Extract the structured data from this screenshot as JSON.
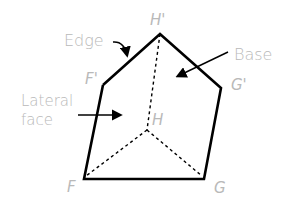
{
  "diagram": {
    "callouts": {
      "edge": "Edge",
      "base": "Base",
      "lateral_line1": "Lateral",
      "lateral_line2": "face"
    },
    "vertices": {
      "H_prime": "H'",
      "F_prime": "F'",
      "G_prime": "G'",
      "F": "F",
      "G": "G",
      "H": "H"
    },
    "colors": {
      "edge_stroke": "#000000",
      "label_text": "#b9b9b9"
    }
  }
}
